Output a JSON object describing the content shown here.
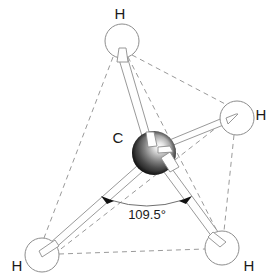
{
  "figure": {
    "background_color": "#ffffff",
    "width": 275,
    "height": 280
  },
  "atoms": [
    {
      "id": "carbon-center",
      "element": "C",
      "label": "C",
      "label_x": 122,
      "label_y": 142,
      "cx": 154,
      "cy": 153,
      "r": 22,
      "style": "shaded-sphere",
      "fill_dark": "#1d1d1d",
      "fill_light": "#ffffff"
    },
    {
      "id": "hydrogen-top",
      "element": "H",
      "label": "H",
      "label_x": 116,
      "label_y": 19,
      "cx": 122,
      "cy": 41,
      "r": 17,
      "style": "open-circle"
    },
    {
      "id": "hydrogen-right",
      "element": "H",
      "label": "H",
      "label_x": 256,
      "label_y": 120,
      "cx": 237,
      "cy": 118,
      "r": 17,
      "style": "open-circle"
    },
    {
      "id": "hydrogen-bottom-left",
      "element": "H",
      "label": "H",
      "label_x": 14,
      "label_y": 269,
      "cx": 42,
      "cy": 255,
      "r": 17,
      "style": "open-circle"
    },
    {
      "id": "hydrogen-bottom-right",
      "element": "H",
      "label": "H",
      "label_x": 243,
      "label_y": 268,
      "cx": 222,
      "cy": 248,
      "r": 17,
      "style": "open-circle"
    }
  ],
  "bonds": [
    {
      "id": "bond-c-h-top",
      "from": "carbon-center",
      "to": "hydrogen-top",
      "style": "cylinder"
    },
    {
      "id": "bond-c-h-right",
      "from": "carbon-center",
      "to": "hydrogen-right",
      "style": "cylinder"
    },
    {
      "id": "bond-c-h-bottom-left",
      "from": "carbon-center",
      "to": "hydrogen-bottom-left",
      "style": "cylinder"
    },
    {
      "id": "bond-c-h-bottom-right",
      "from": "carbon-center",
      "to": "hydrogen-bottom-right",
      "style": "cylinder"
    }
  ],
  "tetrahedron_edges": [
    {
      "id": "edge-top-right",
      "from": "hydrogen-top",
      "to": "hydrogen-right",
      "style": "dashed"
    },
    {
      "id": "edge-top-bottom-left",
      "from": "hydrogen-top",
      "to": "hydrogen-bottom-left",
      "style": "dashed"
    },
    {
      "id": "edge-top-bottom-right",
      "from": "hydrogen-top",
      "to": "hydrogen-bottom-right",
      "style": "dashed"
    },
    {
      "id": "edge-right-bottom-left",
      "from": "hydrogen-right",
      "to": "hydrogen-bottom-left",
      "style": "dashed"
    },
    {
      "id": "edge-right-bottom-right",
      "from": "hydrogen-right",
      "to": "hydrogen-bottom-right",
      "style": "dashed"
    },
    {
      "id": "edge-bottom-left-bottom-right",
      "from": "hydrogen-bottom-left",
      "to": "hydrogen-bottom-right",
      "style": "dashed"
    }
  ],
  "annotation": {
    "id": "bond-angle",
    "value": "109.5",
    "degree_symbol": "°",
    "text": "109.5°",
    "label_x": 130,
    "label_y": 218,
    "arc": {
      "start_x": 107,
      "start_y": 202,
      "end_x": 185,
      "end_y": 202,
      "sag": 10
    },
    "arrowheads": [
      {
        "id": "arrowhead-left",
        "x": 106,
        "y": 201,
        "rotation": 215
      },
      {
        "id": "arrowhead-right",
        "x": 186,
        "y": 201,
        "rotation": 325
      }
    ]
  },
  "colors": {
    "outline_gray": "#8d8d8d",
    "dashed_gray": "#9a9a9a",
    "text_black": "#1a1a1a",
    "arrow_black": "#111111",
    "sphere_dark": "#1d1d1d",
    "sphere_highlight": "#ffffff"
  }
}
